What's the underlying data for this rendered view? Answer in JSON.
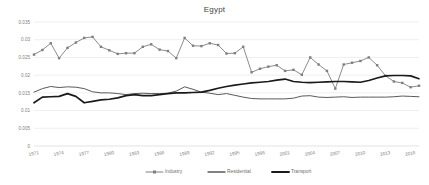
{
  "chart_data": {
    "type": "line",
    "title": "Egypt",
    "xlabel": "",
    "ylabel": "",
    "ylim": [
      0,
      0.035
    ],
    "xlim": [
      1971,
      2017
    ],
    "grid": true,
    "legend_position": "bottom",
    "yticks": [
      "0",
      "0.005",
      "0.01",
      "0.015",
      "0.02",
      "0.025",
      "0.03",
      "0.035"
    ],
    "ytick_values": [
      0,
      0.005,
      0.01,
      0.015,
      0.02,
      0.025,
      0.03,
      0.035
    ],
    "xticks": [
      "1971",
      "1974",
      "1977",
      "1980",
      "1983",
      "1986",
      "1989",
      "1992",
      "1995",
      "1998",
      "2001",
      "2004",
      "2007",
      "2010",
      "2013",
      "2016"
    ],
    "x": [
      1971,
      1972,
      1973,
      1974,
      1975,
      1976,
      1977,
      1978,
      1979,
      1980,
      1981,
      1982,
      1983,
      1984,
      1985,
      1986,
      1987,
      1988,
      1989,
      1990,
      1991,
      1992,
      1993,
      1994,
      1995,
      1996,
      1997,
      1998,
      1999,
      2000,
      2001,
      2002,
      2003,
      2004,
      2005,
      2006,
      2007,
      2008,
      2009,
      2010,
      2011,
      2012,
      2013,
      2014,
      2015,
      2016,
      2017
    ],
    "series": [
      {
        "name": "Industry",
        "color": "#7f7f7f",
        "marker": "square",
        "values": [
          0.0258,
          0.0271,
          0.029,
          0.0248,
          0.0277,
          0.0292,
          0.0305,
          0.0308,
          0.028,
          0.027,
          0.026,
          0.0262,
          0.0262,
          0.028,
          0.0287,
          0.0272,
          0.0268,
          0.0248,
          0.0305,
          0.0283,
          0.0282,
          0.029,
          0.0285,
          0.0261,
          0.0262,
          0.028,
          0.0208,
          0.0218,
          0.0224,
          0.0228,
          0.0212,
          0.0215,
          0.0201,
          0.025,
          0.023,
          0.0212,
          0.0162,
          0.023,
          0.0235,
          0.024,
          0.025,
          0.0228,
          0.0198,
          0.0182,
          0.0178,
          0.0166,
          0.017
        ]
      },
      {
        "name": "Residential",
        "color": "#5a5a5a",
        "marker": "none",
        "values": [
          0.0152,
          0.0162,
          0.0168,
          0.0165,
          0.0167,
          0.0166,
          0.0162,
          0.0153,
          0.015,
          0.015,
          0.0148,
          0.0145,
          0.0148,
          0.0149,
          0.0148,
          0.0148,
          0.0149,
          0.0155,
          0.0167,
          0.016,
          0.0152,
          0.0149,
          0.0145,
          0.0148,
          0.0143,
          0.0138,
          0.0134,
          0.0133,
          0.0133,
          0.0133,
          0.0133,
          0.0135,
          0.0141,
          0.0142,
          0.0138,
          0.0137,
          0.0138,
          0.0139,
          0.0137,
          0.0138,
          0.0138,
          0.0138,
          0.0138,
          0.0139,
          0.0141,
          0.014,
          0.0139
        ]
      },
      {
        "name": "Transport",
        "color": "#1a1a1a",
        "marker": "none",
        "values": [
          0.0122,
          0.0138,
          0.0139,
          0.014,
          0.0148,
          0.014,
          0.0122,
          0.0126,
          0.013,
          0.0132,
          0.0136,
          0.0142,
          0.0145,
          0.0142,
          0.0142,
          0.0145,
          0.0148,
          0.015,
          0.015,
          0.0151,
          0.0152,
          0.0157,
          0.0163,
          0.0168,
          0.0172,
          0.0175,
          0.0178,
          0.018,
          0.0182,
          0.0186,
          0.0189,
          0.0182,
          0.018,
          0.0179,
          0.018,
          0.0181,
          0.0182,
          0.0182,
          0.0181,
          0.018,
          0.0185,
          0.0192,
          0.0198,
          0.0199,
          0.0199,
          0.0198,
          0.019
        ]
      }
    ]
  },
  "legend": {
    "items": [
      {
        "label": "Industry"
      },
      {
        "label": "Residential"
      },
      {
        "label": "Transport"
      }
    ]
  }
}
